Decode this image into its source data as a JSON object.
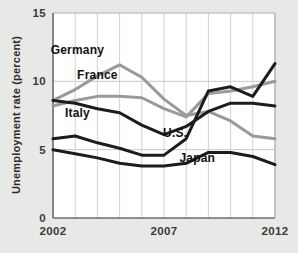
{
  "chart_data": {
    "type": "line",
    "title": "",
    "subtitle": "",
    "xlabel": "",
    "ylabel": "Unemployment rate (percent)",
    "xlim": [
      2002,
      2012
    ],
    "ylim": [
      0,
      15
    ],
    "yticks": [
      0,
      5,
      10,
      15
    ],
    "ytick_labels": [
      "0",
      "5",
      "10",
      "15"
    ],
    "xticks": [
      2002,
      2007,
      2012
    ],
    "xtick_labels": [
      "2002",
      "2007",
      "2012"
    ],
    "grid": "vertical-and-horizontal-light",
    "legend_position": "inline-labels",
    "x": [
      2002,
      2003,
      2004,
      2005,
      2006,
      2007,
      2008,
      2009,
      2010,
      2011,
      2012
    ],
    "series": [
      {
        "name": "Germany",
        "color": "#9a9a9a",
        "style": "gray-thick",
        "values": [
          8.6,
          9.4,
          10.4,
          11.2,
          10.3,
          8.7,
          7.5,
          7.8,
          7.1,
          6.0,
          5.8
        ]
      },
      {
        "name": "France",
        "color": "#9a9a9a",
        "style": "gray-thick",
        "values": [
          8.2,
          8.6,
          8.9,
          8.9,
          8.8,
          8.0,
          7.4,
          9.1,
          9.3,
          9.6,
          10.0
        ]
      },
      {
        "name": "Italy",
        "color": "#1c1c1c",
        "style": "black-thick",
        "values": [
          8.6,
          8.4,
          8.0,
          7.7,
          6.8,
          6.1,
          6.7,
          7.8,
          8.4,
          8.4,
          8.2
        ]
      },
      {
        "name": "U.S.",
        "color": "#1c1c1c",
        "style": "black-thick",
        "values": [
          5.8,
          6.0,
          5.5,
          5.1,
          4.6,
          4.6,
          5.8,
          9.3,
          9.6,
          8.9,
          11.3
        ]
      },
      {
        "name": "Japan",
        "color": "#1c1c1c",
        "style": "black-thick",
        "values": [
          5.0,
          4.7,
          4.4,
          4.0,
          3.8,
          3.8,
          4.0,
          4.8,
          4.8,
          4.5,
          3.9
        ]
      }
    ],
    "annotations": [
      {
        "text": "Germany",
        "x": 2003.1,
        "y": 12.0
      },
      {
        "text": "France",
        "x": 2004.0,
        "y": 10.2
      },
      {
        "text": "Italy",
        "x": 2003.1,
        "y": 7.4
      },
      {
        "text": "U.S.",
        "x": 2007.5,
        "y": 5.9
      },
      {
        "text": "Japan",
        "x": 2008.5,
        "y": 4.1
      }
    ]
  },
  "axis": {
    "y_title": "Unemployment rate (percent)"
  }
}
